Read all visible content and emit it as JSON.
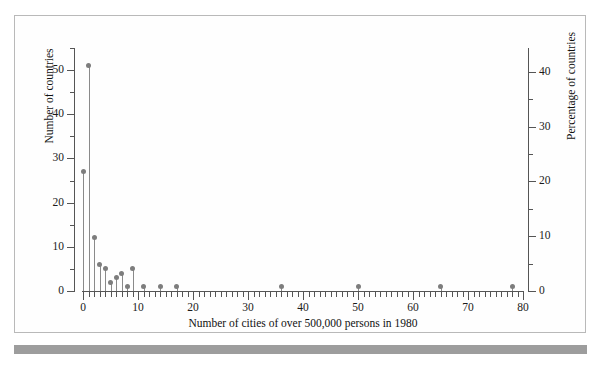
{
  "figure": {
    "background_color": "#ffffff",
    "frame_color": "#b9b9b9",
    "page_edge_color": "#9d9d9d",
    "marker_color": "#7d7d7d",
    "stem_color": "#8a8a8a",
    "axis_color": "#555555"
  },
  "chart_data": {
    "type": "scatter",
    "title": "",
    "subtitle": "",
    "xlabel": "Number of cities of over 500,000 persons in 1980",
    "ylabel": "Number of countries",
    "y2label": "Percentage of countries",
    "xlim": [
      0,
      80
    ],
    "ylim": [
      0,
      55
    ],
    "y2lim": [
      0,
      45
    ],
    "grid": false,
    "legend": null,
    "legend_position": "none",
    "style": "stem-plot (lollipop): vertical stems from y=0 to each value with round markers",
    "xticks_major": [
      0,
      10,
      20,
      30,
      40,
      50,
      60,
      70,
      80
    ],
    "xticks_major_labels": [
      "0",
      "10",
      "20",
      "30",
      "40",
      "50",
      "60",
      "70",
      "80"
    ],
    "xtick_minor_interval": 1,
    "yticks_major": [
      0,
      10,
      20,
      30,
      40,
      50
    ],
    "yticks_major_labels": [
      "0",
      "10",
      "20",
      "30",
      "40",
      "50"
    ],
    "ytick_minor_interval": 5,
    "y2ticks_major": [
      0,
      10,
      20,
      30,
      40
    ],
    "y2ticks_major_labels": [
      "0",
      "10",
      "20",
      "30",
      "40"
    ],
    "y2tick_minor_interval": 5,
    "total_countries": 124,
    "x": [
      0,
      1,
      2,
      3,
      4,
      5,
      6,
      7,
      8,
      9,
      11,
      14,
      17,
      36,
      50,
      65,
      78
    ],
    "values": [
      27,
      51,
      12,
      6,
      5,
      2,
      3,
      4,
      1,
      5,
      1,
      1,
      1,
      1,
      1,
      1,
      1
    ],
    "points": [
      {
        "x": 0,
        "y": 27,
        "percent": 21.8
      },
      {
        "x": 1,
        "y": 51,
        "percent": 41.1
      },
      {
        "x": 2,
        "y": 12,
        "percent": 9.7
      },
      {
        "x": 3,
        "y": 6,
        "percent": 4.8
      },
      {
        "x": 4,
        "y": 5,
        "percent": 4.0
      },
      {
        "x": 5,
        "y": 2,
        "percent": 1.6
      },
      {
        "x": 6,
        "y": 3,
        "percent": 2.4
      },
      {
        "x": 7,
        "y": 4,
        "percent": 3.2
      },
      {
        "x": 8,
        "y": 1,
        "percent": 0.8
      },
      {
        "x": 9,
        "y": 5,
        "percent": 4.0
      },
      {
        "x": 11,
        "y": 1,
        "percent": 0.8
      },
      {
        "x": 14,
        "y": 1,
        "percent": 0.8
      },
      {
        "x": 17,
        "y": 1,
        "percent": 0.8
      },
      {
        "x": 36,
        "y": 1,
        "percent": 0.8
      },
      {
        "x": 50,
        "y": 1,
        "percent": 0.8
      },
      {
        "x": 65,
        "y": 1,
        "percent": 0.8
      },
      {
        "x": 78,
        "y": 1,
        "percent": 0.8
      }
    ]
  }
}
